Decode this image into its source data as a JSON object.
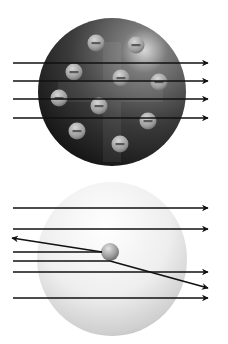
{
  "diagram": {
    "title": "",
    "colors": {
      "background": "#ffffff",
      "arrow": "#111111",
      "thomson_sphere_light": "#6a6a6a",
      "thomson_sphere_dark": "#1a1a1a",
      "electron_light": "#d0d0d0",
      "electron_dark": "#808080",
      "rutherford_sphere_light": "#ffffff",
      "rutherford_sphere_dark": "#b8b8b8",
      "nucleus_light": "#d8d8d8",
      "nucleus_dark": "#6e6e6e"
    },
    "panels": [
      {
        "name": "thomson-model",
        "description": "Plum pudding atom: positive sphere with embedded electrons; all alpha particles pass straight through",
        "electron_count": 11,
        "electron_symbol": "minus",
        "alpha_paths": [
          {
            "type": "straight"
          },
          {
            "type": "straight"
          },
          {
            "type": "straight"
          },
          {
            "type": "straight"
          }
        ]
      },
      {
        "name": "rutherford-model",
        "description": "Nuclear atom: small dense nucleus; most alpha particles pass straight, one is deflected, one bounces back",
        "has_nucleus": true,
        "alpha_paths": [
          {
            "type": "straight"
          },
          {
            "type": "straight"
          },
          {
            "type": "backscattered"
          },
          {
            "type": "deflected"
          },
          {
            "type": "straight"
          },
          {
            "type": "straight"
          }
        ]
      }
    ]
  }
}
